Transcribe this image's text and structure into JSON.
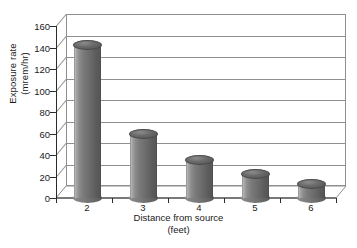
{
  "chart_data": {
    "type": "bar",
    "title": "",
    "subtitle": "",
    "xlabel": "Distance from source",
    "xlabel_unit": "(feet)",
    "ylabel": "Exposure rate",
    "ylabel_unit": "(mrem/hr)",
    "categories": [
      "2",
      "3",
      "4",
      "5",
      "6"
    ],
    "values": [
      142,
      60,
      35,
      22,
      13
    ],
    "ylim": [
      0,
      160
    ],
    "ytick_step": 20,
    "yticks": [
      "0",
      "20",
      "40",
      "60",
      "80",
      "100",
      "120",
      "140",
      "160"
    ],
    "grid": true,
    "grid_axis": "y",
    "legend": false,
    "legend_position": "none",
    "style": "3d-cylinder",
    "series": [
      {
        "name": "Exposure rate",
        "values": [
          142,
          60,
          35,
          22,
          13
        ]
      }
    ],
    "colors": {
      "bar_fill": "#6f6f6f",
      "bar_highlight": "#b9b9b9",
      "bar_shadow": "#565656",
      "bar_top": "#5e5e5e",
      "gridline": "#8f8f8f",
      "axis": "#2b2b2b",
      "plot_background": "#ffffff",
      "text": "#1a1a1a"
    }
  }
}
